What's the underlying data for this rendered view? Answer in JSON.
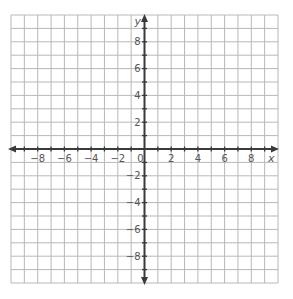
{
  "grid": {
    "x_min": -10,
    "x_max": 10,
    "y_min": -10,
    "y_max": 10,
    "step": 1,
    "line_color": "#b8b8b8",
    "axis_color": "#3a3a3a",
    "label_color": "#555555"
  },
  "axes": {
    "x_label": "x",
    "y_label": "y",
    "x_ticks": [
      {
        "value": -8,
        "label": "−8"
      },
      {
        "value": -6,
        "label": "−6"
      },
      {
        "value": -4,
        "label": "−4"
      },
      {
        "value": -2,
        "label": "−2"
      },
      {
        "value": 0,
        "label": "0"
      },
      {
        "value": 2,
        "label": "2"
      },
      {
        "value": 4,
        "label": "4"
      },
      {
        "value": 6,
        "label": "6"
      },
      {
        "value": 8,
        "label": "8"
      }
    ],
    "y_ticks": [
      {
        "value": 8,
        "label": "8"
      },
      {
        "value": 6,
        "label": "6"
      },
      {
        "value": 4,
        "label": "4"
      },
      {
        "value": 2,
        "label": "2"
      },
      {
        "value": -2,
        "label": "−2"
      },
      {
        "value": -4,
        "label": "−4"
      },
      {
        "value": -6,
        "label": "−6"
      },
      {
        "value": -8,
        "label": "−8"
      }
    ]
  }
}
